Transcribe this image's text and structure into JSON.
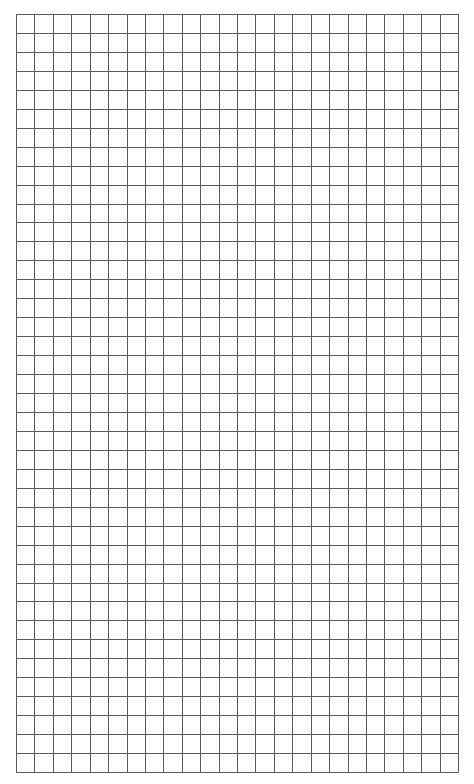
{
  "page": {
    "background": "#ffffff",
    "type": "graph-paper"
  },
  "grid": {
    "columns": 24,
    "rows": 40,
    "line_color": "#5a5a5a",
    "line_width": 1,
    "left": 16,
    "top": 14,
    "width": 442,
    "height": 758
  }
}
